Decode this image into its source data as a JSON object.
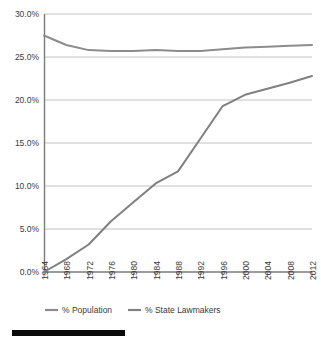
{
  "chart_data": {
    "type": "line",
    "title": "",
    "subtitle": "",
    "xlabel": "",
    "ylabel": "",
    "grid": "horizontal",
    "legend_position": "bottom",
    "x": [
      1964,
      1968,
      1972,
      1976,
      1980,
      1984,
      1988,
      1992,
      1996,
      2000,
      2004,
      2008,
      2012
    ],
    "xtick_labels": [
      "1964",
      "1968",
      "1972",
      "1976",
      "1980",
      "1984",
      "1988",
      "1992",
      "1996",
      "2000",
      "2004",
      "2008",
      "2012"
    ],
    "ytick_labels": [
      "30.0%",
      "25.0%",
      "20.0%",
      "15.0%",
      "10.0%",
      "5.0%",
      "0.0%"
    ],
    "ytick_values": [
      30.0,
      25.0,
      20.0,
      15.0,
      10.0,
      5.0,
      0.0
    ],
    "ylim": [
      0.0,
      30.0
    ],
    "xlim": [
      1964,
      2012
    ],
    "series": [
      {
        "name": "% Population",
        "color": "#8c8c8c",
        "values": [
          27.5,
          26.4,
          25.8,
          25.7,
          25.7,
          25.8,
          25.7,
          25.7,
          25.9,
          26.1,
          26.2,
          26.3,
          26.4
        ]
      },
      {
        "name": "% State Lawmakers",
        "color": "#808080",
        "values": [
          0.0,
          1.5,
          3.2,
          5.9,
          8.1,
          10.3,
          11.7,
          15.5,
          19.3,
          20.6,
          21.3,
          22.0,
          22.8
        ]
      }
    ]
  },
  "legend": {
    "items": [
      {
        "label": "% Population",
        "color": "#8c8c8c"
      },
      {
        "label": "% State Lawmakers",
        "color": "#808080"
      }
    ]
  },
  "footer": {
    "bar_color": "#0a0a0a"
  }
}
